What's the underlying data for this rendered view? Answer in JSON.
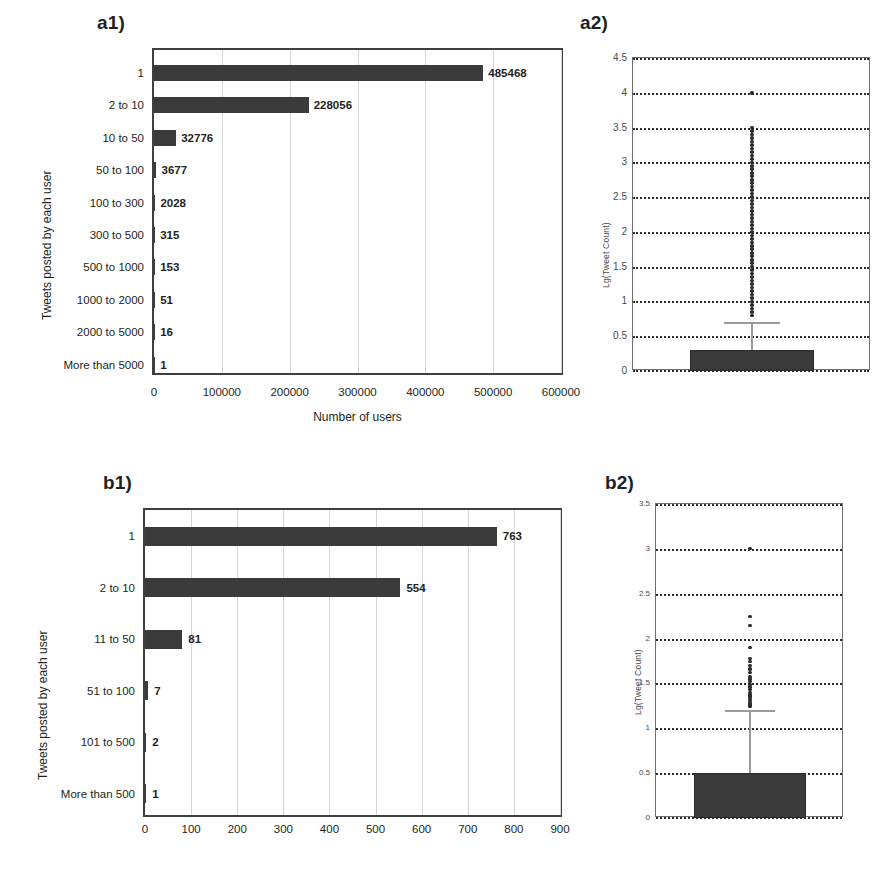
{
  "figure": {
    "background": "#ffffff",
    "bar_color": "#3b3b3b",
    "axis_color": "#3f3f3f",
    "grid_color": "#d7d7d7",
    "outlier_color": "#2b2b2b",
    "whisker_color": "#9a9a9a"
  },
  "panels": {
    "a1": {
      "label": "a1)"
    },
    "a2": {
      "label": "a2)"
    },
    "b1": {
      "label": "b1)"
    },
    "b2": {
      "label": "b2)"
    }
  },
  "chart_data": [
    {
      "id": "a1",
      "type": "bar",
      "orientation": "horizontal",
      "title": "",
      "xlabel": "Number of users",
      "ylabel": "Tweets posted by each user",
      "categories": [
        "1",
        "2 to 10",
        "10 to 50",
        "50 to 100",
        "100 to 300",
        "300 to 500",
        "500 to 1000",
        "1000 to 2000",
        "2000 to 5000",
        "More than 5000"
      ],
      "values": [
        485468,
        228056,
        32776,
        3677,
        2028,
        315,
        153,
        51,
        16,
        1
      ],
      "data_labels": [
        "485468",
        "228056",
        "32776",
        "3677",
        "2028",
        "315",
        "153",
        "51",
        "16",
        "1"
      ],
      "xticks": [
        0,
        100000,
        200000,
        300000,
        400000,
        500000,
        600000
      ],
      "xtick_labels": [
        "0",
        "100000",
        "200000",
        "300000",
        "400000",
        "500000",
        "600000"
      ],
      "xlim": [
        0,
        600000
      ],
      "grid": true,
      "legend": "none"
    },
    {
      "id": "a2",
      "type": "box",
      "title": "",
      "xlabel": "",
      "ylabel": "Lg(Tweet Count)",
      "yticks": [
        0,
        0.5,
        1,
        1.5,
        2,
        2.5,
        3,
        3.5,
        4,
        4.5
      ],
      "ytick_labels": [
        "0",
        "0.5",
        "1",
        "1.5",
        "2",
        "2.5",
        "3",
        "3.5",
        "4",
        "4.5"
      ],
      "ylim": [
        0,
        4.5
      ],
      "grid": true,
      "box": {
        "q1": 0.0,
        "median": 0.0,
        "q3": 0.3,
        "whisker_low": 0.0,
        "whisker_high": 0.7
      },
      "outliers": [
        4.0,
        3.5,
        3.45,
        3.4,
        3.35,
        3.3,
        3.25,
        3.2,
        3.15,
        3.1,
        3.05,
        3.0,
        2.95,
        2.9,
        2.85,
        2.8,
        2.75,
        2.7,
        2.65,
        2.6,
        2.55,
        2.5,
        2.45,
        2.4,
        2.35,
        2.3,
        2.25,
        2.2,
        2.15,
        2.1,
        2.05,
        2.0,
        1.95,
        1.9,
        1.85,
        1.8,
        1.75,
        1.7,
        1.65,
        1.6,
        1.55,
        1.5,
        1.45,
        1.4,
        1.35,
        1.3,
        1.25,
        1.2,
        1.15,
        1.1,
        1.05,
        1.0,
        0.95,
        0.9,
        0.85,
        0.8
      ],
      "legend": "none"
    },
    {
      "id": "b1",
      "type": "bar",
      "orientation": "horizontal",
      "title": "",
      "xlabel": "",
      "ylabel": "Tweets posted by each user",
      "categories": [
        "1",
        "2 to 10",
        "11 to 50",
        "51 to 100",
        "101 to 500",
        "More than 500"
      ],
      "values": [
        763,
        554,
        81,
        7,
        2,
        1
      ],
      "data_labels": [
        "763",
        "554",
        "81",
        "7",
        "2",
        "1"
      ],
      "xticks": [
        0,
        100,
        200,
        300,
        400,
        500,
        600,
        700,
        800,
        900
      ],
      "xtick_labels": [
        "0",
        "100",
        "200",
        "300",
        "400",
        "500",
        "600",
        "700",
        "800",
        "900"
      ],
      "xlim": [
        0,
        900
      ],
      "grid": true,
      "legend": "none"
    },
    {
      "id": "b2",
      "type": "box",
      "title": "",
      "xlabel": "",
      "ylabel": "Lg(Tweet Count)",
      "yticks": [
        0,
        0.5,
        1,
        1.5,
        2,
        2.5,
        3,
        3.5
      ],
      "ytick_labels": [
        "0",
        "0.5",
        "1",
        "1.5",
        "2",
        "2.5",
        "3",
        "3.5"
      ],
      "ylim": [
        0,
        3.5
      ],
      "grid": true,
      "box": {
        "q1": 0.0,
        "median": 0.0,
        "q3": 0.5,
        "whisker_low": 0.0,
        "whisker_high": 1.2
      },
      "outliers": [
        3.0,
        2.25,
        2.15,
        1.9,
        1.78,
        1.74,
        1.7,
        1.66,
        1.62,
        1.58,
        1.55,
        1.52,
        1.49,
        1.46,
        1.43,
        1.4,
        1.38,
        1.36,
        1.34,
        1.32,
        1.3,
        1.28,
        1.26,
        1.24
      ],
      "legend": "none"
    }
  ]
}
